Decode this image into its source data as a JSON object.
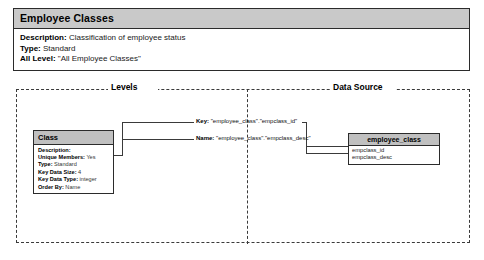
{
  "header": {
    "title": "Employee Classes",
    "rows": [
      {
        "label": "Description:",
        "value": " Classification of employee status"
      },
      {
        "label": "Type:",
        "value": " Standard"
      },
      {
        "label": "All Level:",
        "value": " \"All Employee Classes\""
      }
    ]
  },
  "panel": {
    "levels_caption": "Levels",
    "data_source_caption": "Data Source"
  },
  "level_box": {
    "title": "Class",
    "rows": [
      {
        "label": "Description:",
        "value": ""
      },
      {
        "label": "Unique Members:",
        "value": " Yes"
      },
      {
        "label": "Type:",
        "value": " Standard"
      },
      {
        "label": "Key Data Size:",
        "value": " 4"
      },
      {
        "label": "Key Data Type:",
        "value": " integer"
      },
      {
        "label": "Order By:",
        "value": " Name"
      }
    ]
  },
  "bindings": {
    "key_label": "Key:",
    "key_value": " \"employee_class\".\"empclass_id\"",
    "name_label": "Name:",
    "name_value": " \"employee_class\".\"empclass_desc\""
  },
  "table_box": {
    "title": "employee_class",
    "columns": [
      "empclass_id",
      "empclass_desc"
    ]
  },
  "colors": {
    "title_bar": "#c9c9c9",
    "box_title_bar": "#c0c0c0",
    "border": "#2b2b2b",
    "dashed_border": "#3a3a3a",
    "background": "#ffffff"
  }
}
